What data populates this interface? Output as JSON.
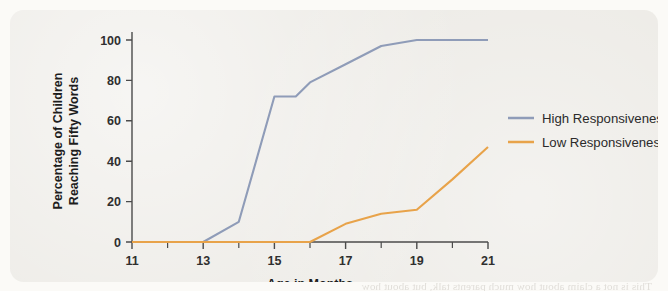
{
  "figure": {
    "panel_background": "#eceae5",
    "page_background": "#fbfaf7",
    "bleed_text": "the other woman's words. And so each time a mother repeats the\nsame few phrases, the child's brain begins to pick out the shape of\nthe sounds. When the mother offers a label in response to the child's\npointing, the word attaches to the object and the meaning begins to\nsettle. Responsiveness, in short, is what makes the difference.\n\nChildren whose mothers respond promptly and contingently to their\nbabbling reach the fifty-word milestone far earlier than those whose\nmothers speak just as often but less responsively. The chart below\nshows the pattern clearly. By fifteen months, nearly three-quarters\nof the high-responsiveness group had crossed the threshold, while\nthe low-responsiveness group had barely begun. Only at nineteen\nmonths did the second group approach the level the first had reached\nfour months earlier.\n\nThis is not a claim about how much parents talk, but about how\nwell they listen."
  },
  "chart_data": {
    "type": "line",
    "title": "",
    "xlabel": "Age in Months",
    "ylabel": "Percentage of Children Reaching Fifty Words",
    "ylabel_lines": [
      "Percentage of Children",
      "Reaching Fifty Words"
    ],
    "xlim": [
      11,
      21
    ],
    "ylim": [
      0,
      100
    ],
    "x_major_ticks": [
      11,
      13,
      15,
      17,
      19,
      21
    ],
    "x_minor_ticks": [
      12,
      14,
      16,
      18,
      20
    ],
    "x_tick_labels": [
      "11",
      "13",
      "15",
      "17",
      "19",
      "21"
    ],
    "y_ticks": [
      0,
      20,
      40,
      60,
      80,
      100
    ],
    "y_tick_labels": [
      "0",
      "20",
      "40",
      "60",
      "80",
      "100"
    ],
    "grid": false,
    "legend_position": "right",
    "series": [
      {
        "name": "High Responsiveness",
        "color": "#8f9cb8",
        "x": [
          11,
          12,
          13,
          14,
          15,
          15.6,
          16,
          17,
          18,
          19,
          20,
          21
        ],
        "values": [
          0,
          0,
          0,
          10,
          72,
          72,
          79,
          88,
          97,
          100,
          100,
          100
        ]
      },
      {
        "name": "Low Responsiveness",
        "color": "#e8a council",
        "x": [
          11,
          13,
          16,
          17,
          18,
          19,
          20,
          21
        ],
        "values": [
          0,
          0,
          0,
          9,
          14,
          16,
          31,
          47
        ]
      }
    ],
    "legend": [
      {
        "label": "High Responsiveness",
        "color": "#8f9cb8"
      },
      {
        "label": "Low Responsiveness",
        "color": "#e8a34a"
      }
    ]
  }
}
